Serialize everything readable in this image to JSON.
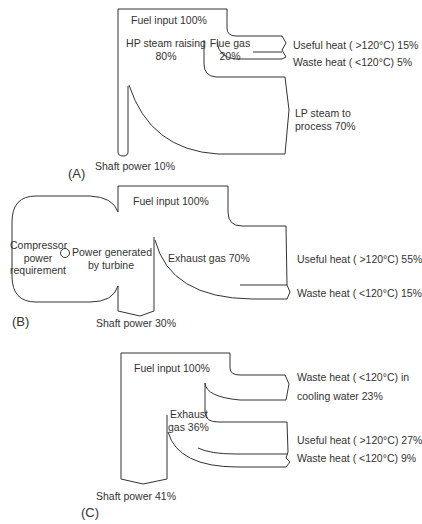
{
  "diagrams": {
    "a": {
      "panel_label": "(A)",
      "fuel_input": "Fuel input 100%",
      "hp_steam_line1": "HP steam raising",
      "hp_steam_line2": "80%",
      "flue_gas_line1": "Flue gas",
      "flue_gas_line2": "20%",
      "useful_heat": "Useful heat ( >120°C) 15%",
      "waste_heat": "Waste heat ( <120°C) 5%",
      "lp_steam_line1": "LP steam to",
      "lp_steam_line2": "process 70%",
      "shaft_power": "Shaft power 10%"
    },
    "b": {
      "panel_label": "(B)",
      "fuel_input": "Fuel input 100%",
      "compressor_line1": "Compressor",
      "compressor_line2": "power",
      "compressor_line3": "requirement",
      "power_gen_line1": "Power generated",
      "power_gen_line2": "by turbine",
      "exhaust_gas": "Exhaust gas 70%",
      "useful_heat": "Useful heat ( >120°C) 55%",
      "waste_heat": "Waste heat ( <120°C) 15%",
      "shaft_power": "Shaft power 30%"
    },
    "c": {
      "panel_label": "(C)",
      "fuel_input": "Fuel input 100%",
      "cooling_line1": "Waste heat ( <120°C) in",
      "cooling_line2": "cooling water 23%",
      "exhaust_line1": "Exhaust",
      "exhaust_line2": "gas 36%",
      "useful_heat": "Useful heat ( >120°C) 27%",
      "waste_heat": "Waste heat ( <120°C) 9%",
      "shaft_power": "Shaft power 41%"
    }
  },
  "colors": {
    "line": "#333333",
    "background": "#ffffff"
  }
}
